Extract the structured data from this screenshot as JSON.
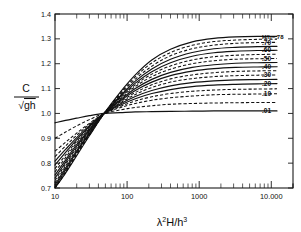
{
  "chart_data": {
    "type": "line",
    "title": "",
    "xlabel": "λ²H/h³",
    "ylabel": "C/√(gh)",
    "xscale": "log",
    "xlim": [
      10,
      20000
    ],
    "ylim": [
      0.7,
      1.4
    ],
    "grid": false,
    "legend_position": "right-inline",
    "xtick_labels": [
      "10",
      "100",
      "1000",
      "10.000"
    ],
    "xtick_values": [
      10,
      100,
      1000,
      10000
    ],
    "ytick_labels": [
      "0.7",
      "0.8",
      "0.9",
      "1.0",
      "1.1",
      "1.2",
      "1.3",
      "1.4"
    ],
    "ytick_values": [
      0.7,
      0.8,
      0.9,
      1.0,
      1.1,
      1.2,
      1.3,
      1.4
    ],
    "crossing_point": {
      "x": 48,
      "y": 1.0
    },
    "annotations": [
      "H/h=.78"
    ],
    "series": [
      {
        "name": "H/h=.78",
        "label": "H/h=.78",
        "style": "solid",
        "x": [
          10,
          14,
          20,
          30,
          48,
          80,
          130,
          220,
          400,
          800,
          1600,
          3200,
          6400,
          12000
        ],
        "values": [
          0.7,
          0.76,
          0.83,
          0.91,
          1.0,
          1.085,
          1.155,
          1.215,
          1.258,
          1.288,
          1.302,
          1.308,
          1.31,
          1.31
        ]
      },
      {
        "name": "0.70",
        "label": ".70",
        "style": "dashed",
        "x": [
          10,
          14,
          20,
          30,
          48,
          80,
          130,
          220,
          400,
          800,
          1600,
          3200,
          6400,
          12000
        ],
        "values": [
          0.7,
          0.765,
          0.84,
          0.915,
          1.0,
          1.075,
          1.138,
          1.19,
          1.232,
          1.26,
          1.275,
          1.282,
          1.285,
          1.286
        ]
      },
      {
        "name": "0.60",
        "label": ".60",
        "style": "solid",
        "x": [
          10,
          14,
          20,
          30,
          48,
          80,
          130,
          220,
          400,
          800,
          1600,
          3200,
          6400,
          12000
        ],
        "values": [
          0.712,
          0.78,
          0.85,
          0.92,
          1.0,
          1.066,
          1.122,
          1.168,
          1.204,
          1.23,
          1.244,
          1.25,
          1.253,
          1.254
        ]
      },
      {
        "name": "0.50",
        "label": ".50",
        "style": "dashed",
        "x": [
          10,
          14,
          20,
          30,
          48,
          80,
          130,
          220,
          400,
          800,
          1600,
          3200,
          6400,
          12000
        ],
        "values": [
          0.73,
          0.795,
          0.862,
          0.928,
          1.0,
          1.058,
          1.108,
          1.148,
          1.178,
          1.2,
          1.212,
          1.218,
          1.22,
          1.221
        ]
      },
      {
        "name": "0.40",
        "label": ".40",
        "style": "solid",
        "x": [
          10,
          14,
          20,
          30,
          48,
          80,
          130,
          220,
          400,
          800,
          1600,
          3200,
          6400,
          12000
        ],
        "values": [
          0.752,
          0.812,
          0.875,
          0.935,
          1.0,
          1.05,
          1.092,
          1.126,
          1.152,
          1.17,
          1.18,
          1.185,
          1.187,
          1.188
        ]
      },
      {
        "name": "0.30",
        "label": ".30",
        "style": "dashed",
        "x": [
          10,
          14,
          20,
          30,
          48,
          80,
          130,
          220,
          400,
          800,
          1600,
          3200,
          6400,
          12000
        ],
        "values": [
          0.778,
          0.832,
          0.888,
          0.942,
          1.0,
          1.042,
          1.076,
          1.104,
          1.126,
          1.14,
          1.148,
          1.152,
          1.154,
          1.155
        ]
      },
      {
        "name": "0.20",
        "label": ".20",
        "style": "solid",
        "x": [
          10,
          14,
          20,
          30,
          48,
          80,
          130,
          220,
          400,
          800,
          1600,
          3200,
          6400,
          12000
        ],
        "values": [
          0.808,
          0.855,
          0.903,
          0.951,
          1.0,
          1.033,
          1.059,
          1.08,
          1.096,
          1.108,
          1.114,
          1.117,
          1.119,
          1.12
        ]
      },
      {
        "name": "0.10",
        "label": ".10",
        "style": "dashed",
        "x": [
          10,
          14,
          20,
          30,
          48,
          80,
          130,
          220,
          400,
          800,
          1600,
          3200,
          6400,
          12000
        ],
        "values": [
          0.848,
          0.884,
          0.921,
          0.96,
          1.0,
          1.023,
          1.04,
          1.053,
          1.063,
          1.07,
          1.075,
          1.077,
          1.078,
          1.079
        ]
      },
      {
        "name": "0.01",
        "label": ".01",
        "style": "solid",
        "x": [
          10,
          14,
          20,
          30,
          48,
          80,
          130,
          220,
          400,
          800,
          1600,
          3200,
          6400,
          12000
        ],
        "values": [
          0.962,
          0.972,
          0.981,
          0.991,
          1.0,
          1.003,
          1.006,
          1.007,
          1.008,
          1.009,
          1.01,
          1.01,
          1.01,
          1.01
        ]
      },
      {
        "name": "0.74",
        "label": "",
        "style": "dashed",
        "x": [
          10,
          14,
          20,
          30,
          48,
          80,
          130,
          220,
          400,
          800,
          1600,
          3200,
          6400,
          12000
        ],
        "values": [
          0.7,
          0.762,
          0.835,
          0.912,
          1.0,
          1.08,
          1.147,
          1.203,
          1.245,
          1.274,
          1.289,
          1.295,
          1.298,
          1.298
        ]
      },
      {
        "name": "0.65",
        "label": "",
        "style": "solid",
        "x": [
          10,
          14,
          20,
          30,
          48,
          80,
          130,
          220,
          400,
          800,
          1600,
          3200,
          6400,
          12000
        ],
        "values": [
          0.705,
          0.772,
          0.845,
          0.918,
          1.0,
          1.07,
          1.13,
          1.179,
          1.218,
          1.245,
          1.26,
          1.266,
          1.269,
          1.27
        ]
      },
      {
        "name": "0.55",
        "label": "",
        "style": "dashed",
        "x": [
          10,
          14,
          20,
          30,
          48,
          80,
          130,
          220,
          400,
          800,
          1600,
          3200,
          6400,
          12000
        ],
        "values": [
          0.72,
          0.788,
          0.856,
          0.924,
          1.0,
          1.062,
          1.115,
          1.158,
          1.191,
          1.215,
          1.228,
          1.234,
          1.237,
          1.238
        ]
      },
      {
        "name": "0.45",
        "label": "",
        "style": "solid",
        "x": [
          10,
          14,
          20,
          30,
          48,
          80,
          130,
          220,
          400,
          800,
          1600,
          3200,
          6400,
          12000
        ],
        "values": [
          0.74,
          0.803,
          0.868,
          0.931,
          1.0,
          1.054,
          1.1,
          1.137,
          1.165,
          1.185,
          1.196,
          1.202,
          1.204,
          1.205
        ]
      },
      {
        "name": "0.35",
        "label": "",
        "style": "dashed",
        "x": [
          10,
          14,
          20,
          30,
          48,
          80,
          130,
          220,
          400,
          800,
          1600,
          3200,
          6400,
          12000
        ],
        "values": [
          0.765,
          0.822,
          0.882,
          0.939,
          1.0,
          1.046,
          1.084,
          1.115,
          1.139,
          1.155,
          1.164,
          1.169,
          1.171,
          1.172
        ]
      },
      {
        "name": "0.25",
        "label": "",
        "style": "solid",
        "x": [
          10,
          14,
          20,
          30,
          48,
          80,
          130,
          220,
          400,
          800,
          1600,
          3200,
          6400,
          12000
        ],
        "values": [
          0.792,
          0.843,
          0.895,
          0.947,
          1.0,
          1.038,
          1.068,
          1.092,
          1.111,
          1.124,
          1.131,
          1.135,
          1.136,
          1.137
        ]
      },
      {
        "name": "0.15",
        "label": "",
        "style": "dashed",
        "x": [
          10,
          14,
          20,
          30,
          48,
          80,
          130,
          220,
          400,
          800,
          1600,
          3200,
          6400,
          12000
        ],
        "values": [
          0.826,
          0.869,
          0.912,
          0.956,
          1.0,
          1.028,
          1.05,
          1.067,
          1.08,
          1.089,
          1.094,
          1.097,
          1.098,
          1.099
        ]
      },
      {
        "name": "0.05",
        "label": "",
        "style": "dashed",
        "x": [
          10,
          14,
          20,
          30,
          48,
          80,
          130,
          220,
          400,
          800,
          1600,
          3200,
          6400,
          12000
        ],
        "values": [
          0.9,
          0.925,
          0.95,
          0.975,
          1.0,
          1.014,
          1.024,
          1.031,
          1.037,
          1.04,
          1.042,
          1.043,
          1.044,
          1.044
        ]
      }
    ]
  },
  "axis": {
    "y_label_numerator": "C",
    "y_label_denominator": "gh",
    "y_label_radical": "√",
    "x_label_lambda": "λ",
    "x_label_lambda_sup": "2",
    "x_label_H": "H/h",
    "x_label_h_sup": "3"
  }
}
